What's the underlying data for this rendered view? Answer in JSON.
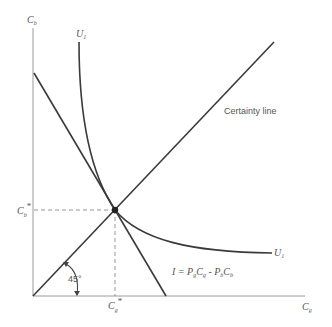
{
  "diagram": {
    "type": "indifference-curve-diagram",
    "axes": {
      "y_label": "C",
      "y_label_sub": "b",
      "x_label": "C",
      "x_label_sub": "g"
    },
    "labels": {
      "certainty_line": "Certainty line",
      "utility_curve_top": "U",
      "utility_curve_right": "U",
      "utility_sub": "1",
      "budget_line_prefix": "I = P",
      "budget_line_eq": "I = PgCg - PbCb",
      "budget_parts": {
        "i": "I",
        "eq": " = ",
        "p1": "P",
        "p1_sub": "g",
        "c1": "C",
        "c1_sub": "g",
        "minus": " - ",
        "p2": "P",
        "p2_sub": "b",
        "c2": "C",
        "c2_sub": "b"
      },
      "angle": "45°",
      "cb_star": "C",
      "cb_star_sub": "b",
      "cg_star": "C",
      "cg_star_sub": "g",
      "star": "*"
    },
    "points": {
      "origin": [
        33,
        296
      ],
      "tangency": [
        115,
        210
      ],
      "budget_y_intercept": [
        34,
        73
      ],
      "budget_x_intercept": [
        166,
        296
      ],
      "certainty_end": [
        274,
        42
      ]
    }
  }
}
